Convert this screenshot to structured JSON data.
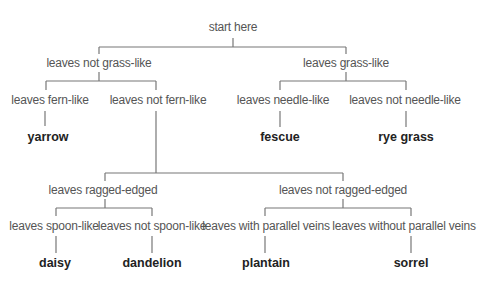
{
  "root": {
    "label": "start here"
  },
  "level1": [
    {
      "label": "leaves not grass-like"
    },
    {
      "label": "leaves grass-like"
    }
  ],
  "level2": [
    {
      "label": "leaves fern-like"
    },
    {
      "label": "leaves not fern-like"
    },
    {
      "label": "leaves needle-like"
    },
    {
      "label": "leaves not needle-like"
    }
  ],
  "leaves_top": [
    {
      "label": "yarrow"
    },
    {
      "label": "fescue"
    },
    {
      "label": "rye grass"
    }
  ],
  "level3": [
    {
      "label": "leaves ragged-edged"
    },
    {
      "label": "leaves not ragged-edged"
    }
  ],
  "level4": [
    {
      "label": "leaves spoon-like"
    },
    {
      "label": "leaves not spoon-like"
    },
    {
      "label": "leaves with parallel veins"
    },
    {
      "label": "leaves without parallel veins"
    }
  ],
  "leaves_bottom": [
    {
      "label": "daisy"
    },
    {
      "label": "dandelion"
    },
    {
      "label": "plantain"
    },
    {
      "label": "sorrel"
    }
  ]
}
